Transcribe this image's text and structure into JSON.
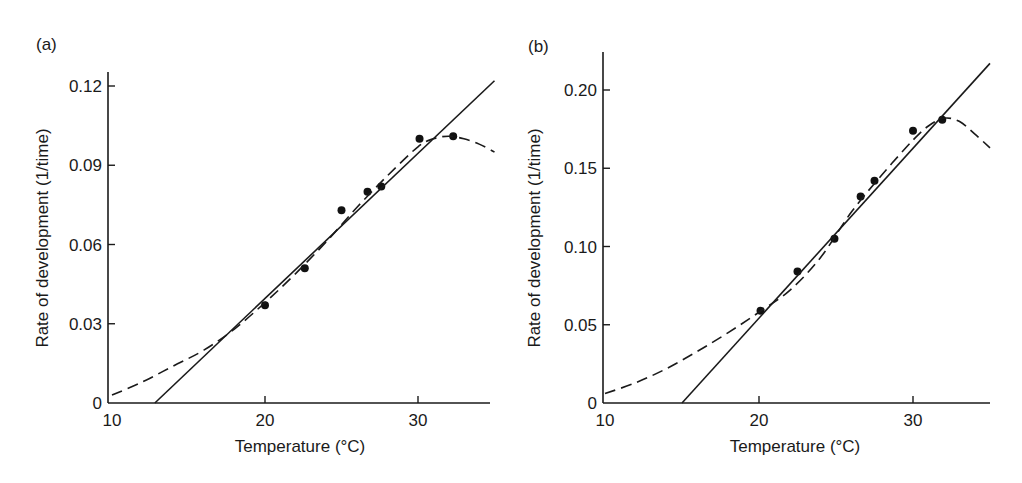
{
  "chart_data": [
    {
      "type": "scatter",
      "panel_label": "(a)",
      "xlabel": "Temperature (°C)",
      "ylabel": "Rate of development (1/time)",
      "xlim": [
        10,
        35
      ],
      "ylim": [
        0,
        0.125
      ],
      "xticks": [
        10,
        20,
        30
      ],
      "xtick_labels": [
        "10",
        "20",
        "30"
      ],
      "yticks": [
        0,
        0.03,
        0.06,
        0.09,
        0.12
      ],
      "ytick_labels": [
        "0",
        "0.03",
        "0.06",
        "0.09",
        "0.12"
      ],
      "grid": false,
      "series": [
        {
          "name": "observed",
          "style": "points",
          "x": [
            20.0,
            22.6,
            25.0,
            26.7,
            27.6,
            30.1,
            32.3
          ],
          "y": [
            0.037,
            0.051,
            0.073,
            0.08,
            0.082,
            0.1,
            0.101
          ]
        },
        {
          "name": "linear fit",
          "style": "solid",
          "x": [
            12.8,
            35.0
          ],
          "y": [
            0.0,
            0.122
          ]
        },
        {
          "name": "nonlinear fit",
          "style": "dashed",
          "x": [
            10,
            12,
            14,
            16,
            18,
            20,
            22,
            24,
            26,
            28,
            30,
            31,
            32,
            33,
            34,
            35
          ],
          "y": [
            0.003,
            0.008,
            0.014,
            0.02,
            0.028,
            0.038,
            0.049,
            0.061,
            0.074,
            0.086,
            0.097,
            0.1,
            0.101,
            0.1,
            0.098,
            0.095
          ]
        }
      ]
    },
    {
      "type": "scatter",
      "panel_label": "(b)",
      "xlabel": "Temperature (°C)",
      "ylabel": "Rate of development (1/time)",
      "xlim": [
        10,
        35
      ],
      "ylim": [
        0,
        0.22
      ],
      "xticks": [
        10,
        20,
        30
      ],
      "xtick_labels": [
        "10",
        "20",
        "30"
      ],
      "yticks": [
        0,
        0.05,
        0.1,
        0.15,
        0.2
      ],
      "ytick_labels": [
        "0",
        "0.05",
        "0.10",
        "0.15",
        "0.20"
      ],
      "grid": false,
      "series": [
        {
          "name": "observed",
          "style": "points",
          "x": [
            20.1,
            22.5,
            24.9,
            26.6,
            27.5,
            30.0,
            31.9
          ],
          "y": [
            0.059,
            0.084,
            0.105,
            0.132,
            0.142,
            0.174,
            0.181
          ]
        },
        {
          "name": "linear fit",
          "style": "solid",
          "x": [
            15.0,
            35.0
          ],
          "y": [
            0.0,
            0.217
          ]
        },
        {
          "name": "nonlinear fit",
          "style": "dashed",
          "x": [
            10,
            12,
            14,
            16,
            18,
            20,
            22,
            24,
            26,
            28,
            30,
            31,
            32,
            33,
            34,
            35
          ],
          "y": [
            0.006,
            0.013,
            0.022,
            0.033,
            0.045,
            0.058,
            0.072,
            0.093,
            0.122,
            0.146,
            0.168,
            0.177,
            0.182,
            0.18,
            0.172,
            0.163
          ]
        }
      ]
    }
  ]
}
